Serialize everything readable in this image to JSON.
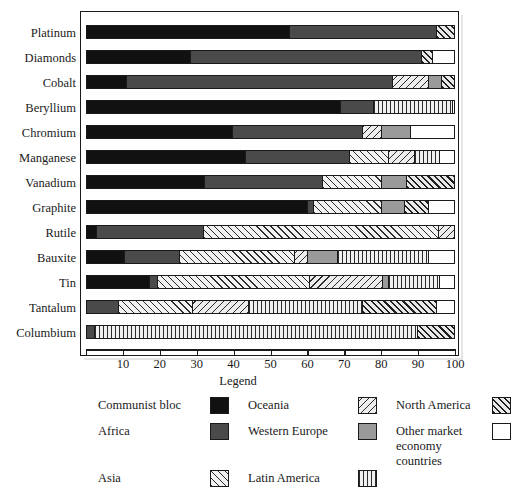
{
  "chart_data": {
    "type": "bar",
    "orientation": "horizontal",
    "stacked": true,
    "title": "",
    "xlabel": "",
    "ylabel": "",
    "xlim": [
      0,
      100
    ],
    "xticks": [
      0,
      10,
      20,
      30,
      40,
      50,
      60,
      70,
      80,
      90,
      100
    ],
    "xtick_labels": [
      "",
      "10",
      "20",
      "30",
      "40",
      "50",
      "60",
      "70",
      "80",
      "90",
      "100"
    ],
    "grid": false,
    "legend_position": "below",
    "categories": [
      "Platinum",
      "Diamonds",
      "Cobalt",
      "Beryllium",
      "Chromium",
      "Manganese",
      "Vanadium",
      "Graphite",
      "Rutile",
      "Bauxite",
      "Tin",
      "Tantalum",
      "Columbium"
    ],
    "series": [
      {
        "name": "Communist bloc",
        "key": "communist",
        "values": [
          55,
          28,
          10.5,
          69,
          39.5,
          43,
          32,
          60,
          2.5,
          10,
          17,
          0,
          0
        ]
      },
      {
        "name": "Africa",
        "key": "africa",
        "values": [
          40,
          63,
          72.5,
          9,
          35.5,
          28.5,
          32,
          1.5,
          29,
          15,
          2,
          8.5,
          2
        ]
      },
      {
        "name": "Asia",
        "key": "asia",
        "values": [
          0,
          0,
          0,
          0,
          0,
          10.5,
          16,
          18.5,
          64,
          31.5,
          41.5,
          20,
          0
        ]
      },
      {
        "name": "Oceania",
        "key": "oceania",
        "values": [
          0,
          0,
          10,
          0,
          5,
          7,
          0,
          0,
          4.5,
          3.5,
          20,
          15.5,
          0
        ]
      },
      {
        "name": "Western Europe",
        "key": "westeurope",
        "values": [
          0,
          0,
          3.5,
          0,
          8,
          0,
          7,
          6.5,
          0,
          8,
          1.5,
          0,
          0
        ]
      },
      {
        "name": "Latin America",
        "key": "latinamerica",
        "values": [
          0,
          0,
          0,
          21.5,
          0,
          7,
          0,
          0,
          0,
          25,
          14,
          31,
          88
        ]
      },
      {
        "name": "North America",
        "key": "northamerica",
        "values": [
          5,
          3,
          3.5,
          0,
          0,
          0,
          13,
          6.5,
          0,
          0,
          0,
          20,
          10
        ]
      },
      {
        "name": "Other market economy countries",
        "key": "other",
        "values": [
          0,
          6,
          0,
          0.5,
          12,
          4,
          0,
          7,
          0,
          7,
          4,
          5,
          0
        ]
      }
    ]
  },
  "legend": {
    "title": "Legend",
    "entries": [
      {
        "label": "Communist bloc",
        "key": "communist"
      },
      {
        "label": "Oceania",
        "key": "oceania"
      },
      {
        "label": "North America",
        "key": "northamerica"
      },
      {
        "label": "Africa",
        "key": "africa"
      },
      {
        "label": "Western Europe",
        "key": "westeurope"
      },
      {
        "label": "Other market\neconomy\ncountries",
        "key": "other"
      },
      {
        "label": "Asia",
        "key": "asia"
      },
      {
        "label": "Latin America",
        "key": "latinamerica"
      },
      {
        "label": "",
        "key": "blank"
      }
    ]
  }
}
